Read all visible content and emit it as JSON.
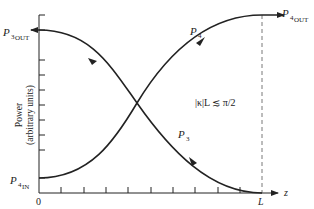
{
  "diagram": {
    "y_axis_label_line1": "Power",
    "y_axis_label_line2": "(arbitrary units)",
    "x_axis_label": "z",
    "origin_label": "0",
    "end_label": "L",
    "condition_text": "|κ|L ≲ π/2",
    "curves": [
      {
        "name": "P4",
        "label": "P",
        "sub": "4",
        "direction": "forward (+z)",
        "start_label": "P",
        "start_sub": "4IN",
        "end_label": "P",
        "end_sub": "4OUT"
      },
      {
        "name": "P3",
        "label": "P",
        "sub": "3",
        "direction": "backward (-z)",
        "start_label": "P",
        "start_sub": "3OUT"
      }
    ],
    "labels": {
      "p3out_main": "P",
      "p3out_sub1": "3",
      "p3out_sub2": "OUT",
      "p4in_main": "P",
      "p4in_sub1": "4",
      "p4in_sub2": "IN",
      "p4out_main": "P",
      "p4out_sub1": "4",
      "p4out_sub2": "OUT",
      "p4_main": "P",
      "p4_sub": "4",
      "p3_main": "P",
      "p3_sub": "3"
    },
    "colors": {
      "line": "#222222",
      "dashed": "#555555",
      "background": "#ffffff"
    }
  }
}
